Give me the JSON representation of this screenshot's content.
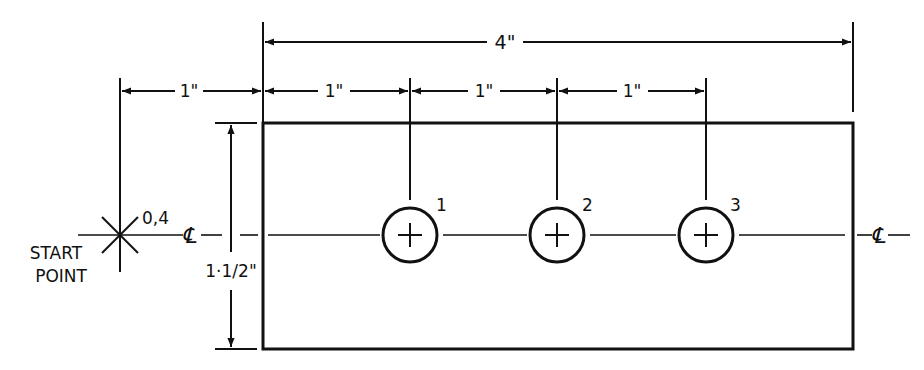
{
  "drawing": {
    "type": "dimensioned part drawing",
    "colors": {
      "ink": "#111111",
      "background": "#ffffff"
    },
    "part": {
      "width_label": "4\"",
      "height_label": "1·1/2\"",
      "rect": {
        "x": 263,
        "y": 123,
        "w": 590,
        "h": 226
      }
    },
    "start_point": {
      "label_line1": "START",
      "label_line2": "POINT",
      "coordinates": "0,4",
      "offset_label": "1\""
    },
    "centerline_symbol": "℄",
    "hole_spacing_labels": [
      "1\"",
      "1\"",
      "1\""
    ],
    "holes": [
      {
        "number": "1",
        "cx": 410,
        "cy": 235,
        "r": 27
      },
      {
        "number": "2",
        "cx": 557,
        "cy": 235,
        "r": 27
      },
      {
        "number": "3",
        "cx": 706,
        "cy": 235,
        "r": 27
      }
    ]
  }
}
